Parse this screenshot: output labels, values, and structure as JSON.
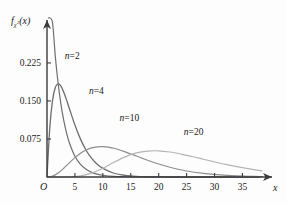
{
  "chart_data": {
    "type": "line",
    "title": "",
    "subtitle": "",
    "xlabel": "x",
    "ylabel": "f_chi2(x)",
    "ylabel_parts": {
      "func": "f",
      "sub_base": "χ",
      "sub_exp": "2",
      "arg": "(x)"
    },
    "xlim": [
      0,
      38.5
    ],
    "ylim": [
      0,
      0.29
    ],
    "xticks": [
      5,
      10,
      15,
      20,
      25,
      30,
      35
    ],
    "xtick_labels": [
      "5",
      "10",
      "15",
      "20",
      "25",
      "30",
      "35"
    ],
    "yticks": [
      0.075,
      0.15,
      0.225
    ],
    "ytick_labels": [
      "0.075",
      "0.150",
      "0.225"
    ],
    "origin_label": "O",
    "grid": false,
    "legend_position": "inline-annotations",
    "series": [
      {
        "name": "n=2",
        "label": "n=2",
        "df": 2,
        "color": "#6e6e6e",
        "width": 1.2,
        "label_x": 3.2,
        "label_y": 0.2335,
        "peak_x": 0,
        "peak_y": 0.5,
        "x": [
          0.25,
          0.5,
          1,
          1.5,
          2,
          2.5,
          3,
          3.5,
          4,
          5,
          6,
          7,
          8,
          9,
          10,
          12,
          14,
          16,
          18,
          20,
          24,
          28,
          32,
          36,
          38
        ],
        "y": [
          0.4412,
          0.3894,
          0.3033,
          0.2362,
          0.1839,
          0.1433,
          0.1116,
          0.0869,
          0.0677,
          0.041,
          0.0249,
          0.0151,
          0.0092,
          0.0056,
          0.0034,
          0.0012,
          0.0005,
          0.0002,
          0.0001,
          0.0,
          0.0,
          0.0,
          0.0,
          0.0,
          0.0
        ]
      },
      {
        "name": "n=4",
        "label": "n=4",
        "df": 4,
        "color": "#6e6e6e",
        "width": 1.3,
        "label_x": 7.5,
        "label_y": 0.1645,
        "peak_x": 2,
        "peak_y": 0.1839,
        "x": [
          0,
          0.5,
          1,
          1.5,
          2,
          2.5,
          3,
          3.5,
          4,
          5,
          6,
          7,
          8,
          9,
          10,
          12,
          14,
          16,
          18,
          20,
          24,
          28,
          32,
          36,
          38
        ],
        "y": [
          0.0,
          0.0974,
          0.1516,
          0.1772,
          0.1839,
          0.1791,
          0.1673,
          0.1521,
          0.1353,
          0.1026,
          0.0747,
          0.0528,
          0.0366,
          0.025,
          0.0169,
          0.0074,
          0.0032,
          0.0013,
          0.0006,
          0.0002,
          0.0,
          0.0,
          0.0,
          0.0,
          0.0
        ]
      },
      {
        "name": "n=10",
        "label": "n=10",
        "df": 10,
        "color": "#8d8d8d",
        "width": 1.2,
        "label_x": 13.0,
        "label_y": 0.1105,
        "peak_x": 8,
        "peak_y": 0.0977,
        "x": [
          0,
          1,
          2,
          3,
          4,
          5,
          6,
          7,
          8,
          9,
          10,
          11,
          12,
          14,
          16,
          18,
          20,
          22,
          25,
          28,
          31,
          34,
          37,
          38.5
        ],
        "y": [
          0.0,
          0.0016,
          0.0077,
          0.0172,
          0.028,
          0.0383,
          0.0469,
          0.0532,
          0.0573,
          0.0594,
          0.0598,
          0.0588,
          0.0567,
          0.0497,
          0.0414,
          0.0331,
          0.0256,
          0.0193,
          0.0119,
          0.007,
          0.004,
          0.0023,
          0.0012,
          0.0009
        ]
      },
      {
        "name": "n=20",
        "label": "n=20",
        "df": 20,
        "color": "#b4b4b4",
        "width": 1.2,
        "label_x": 24.5,
        "label_y": 0.0835,
        "peak_x": 18,
        "peak_y": 0.0625,
        "x": [
          0,
          2,
          4,
          6,
          8,
          10,
          12,
          14,
          16,
          18,
          20,
          22,
          24,
          26,
          28,
          30,
          32,
          34,
          36,
          38.5
        ],
        "y": [
          0.0,
          0.0,
          0.0003,
          0.0022,
          0.0077,
          0.0174,
          0.0292,
          0.0398,
          0.0475,
          0.0512,
          0.0516,
          0.0493,
          0.0453,
          0.0404,
          0.0351,
          0.0298,
          0.0248,
          0.0203,
          0.0164,
          0.0122
        ]
      }
    ]
  },
  "colors": {
    "background": "#fdfdfd",
    "axis": "#3a3a3a",
    "text": "#1a1a1a"
  }
}
